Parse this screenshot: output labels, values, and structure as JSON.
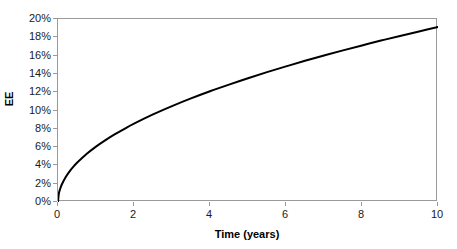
{
  "chart_data": {
    "type": "line",
    "title": "",
    "subtitle": "",
    "xlabel": "Time (years)",
    "ylabel": "EE",
    "xlim": [
      0,
      10
    ],
    "ylim": [
      0,
      0.2
    ],
    "grid": false,
    "legend": false,
    "legend_position": "none",
    "x_tick_labels": [
      "0",
      "2",
      "4",
      "6",
      "8",
      "10"
    ],
    "x_ticks": [
      0,
      2,
      4,
      6,
      8,
      10
    ],
    "y_tick_labels": [
      "0%",
      "2%",
      "4%",
      "6%",
      "8%",
      "10%",
      "12%",
      "14%",
      "16%",
      "18%",
      "20%"
    ],
    "y_ticks": [
      0,
      0.02,
      0.04,
      0.06,
      0.08,
      0.1,
      0.12,
      0.14,
      0.16,
      0.18,
      0.2
    ],
    "series": [
      {
        "name": "EE",
        "color": "#000000",
        "line_width": 2,
        "x": [
          0,
          0.02,
          0.05,
          0.1,
          0.2,
          0.3,
          0.4,
          0.5,
          0.75,
          1,
          1.25,
          1.5,
          1.75,
          2,
          2.5,
          3,
          3.5,
          4,
          4.5,
          5,
          5.5,
          6,
          6.5,
          7,
          7.5,
          8,
          8.5,
          9,
          9.5,
          10
        ],
        "values": [
          0,
          0.0086,
          0.0135,
          0.0191,
          0.027,
          0.0331,
          0.0383,
          0.0428,
          0.0524,
          0.0605,
          0.0676,
          0.0741,
          0.08,
          0.0856,
          0.0957,
          0.1048,
          0.1132,
          0.121,
          0.1283,
          0.1353,
          0.1419,
          0.1482,
          0.1543,
          0.1601,
          0.1657,
          0.1711,
          0.1764,
          0.1815,
          0.1864,
          0.1913
        ]
      }
    ],
    "annotations": []
  },
  "axes": {
    "y_title": "EE",
    "x_title": "Time (years)",
    "y_labels": [
      "20%",
      "18%",
      "16%",
      "14%",
      "12%",
      "10%",
      "8%",
      "6%",
      "4%",
      "2%",
      "0%"
    ],
    "x_labels": [
      "0",
      "2",
      "4",
      "6",
      "8",
      "10"
    ]
  },
  "colors": {
    "curve": "#000000",
    "frame": "#9a9a9a",
    "tick": "#9a9a9a",
    "text": "#1a1a1a",
    "title_text": "#000000",
    "background": "#ffffff"
  }
}
